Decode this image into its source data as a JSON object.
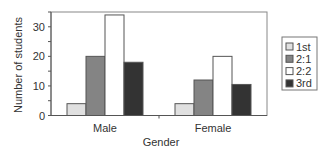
{
  "chart_data": {
    "type": "bar",
    "title": "",
    "xlabel": "Gender",
    "ylabel": "Number of students",
    "categories": [
      "Male",
      "Female"
    ],
    "series": [
      {
        "name": "1st",
        "values": [
          4,
          4
        ],
        "color": "#e0e0e0"
      },
      {
        "name": "2:1",
        "values": [
          20,
          12
        ],
        "color": "#848484"
      },
      {
        "name": "2:2",
        "values": [
          34,
          20
        ],
        "color": "#ffffff"
      },
      {
        "name": "3rd",
        "values": [
          18,
          10.5
        ],
        "color": "#333333"
      }
    ],
    "ylim": [
      0,
      35
    ],
    "yticks": [
      0,
      10,
      20,
      30
    ],
    "grid": false,
    "legend_position": "right"
  }
}
